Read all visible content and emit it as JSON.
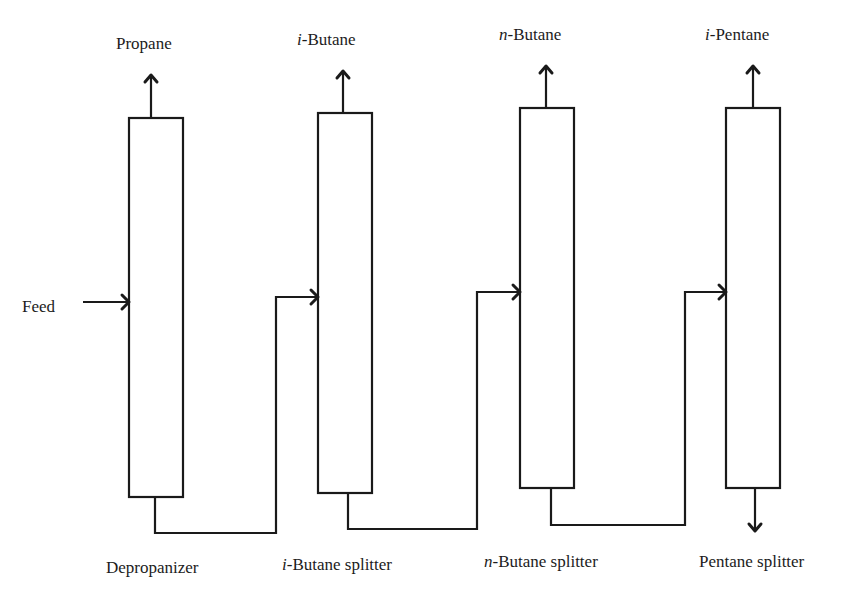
{
  "diagram": {
    "type": "process-flow",
    "feed_label": "Feed",
    "columns": [
      {
        "name": "Depropanizer",
        "top_product_prefix": "",
        "top_product": "Propane",
        "name_prefix": ""
      },
      {
        "name": "Butane splitter",
        "name_prefix": "i",
        "top_product_prefix": "i",
        "top_product": "Butane"
      },
      {
        "name": "Butane splitter",
        "name_prefix": "n",
        "top_product_prefix": "n",
        "top_product": "Butane"
      },
      {
        "name": "Pentane splitter",
        "name_prefix": "",
        "top_product_prefix": "i",
        "top_product": "Pentane"
      }
    ],
    "labels": {
      "top": [
        "Propane",
        "i-Butane",
        "n-Butane",
        "i-Pentane"
      ],
      "bottom": [
        "Depropanizer",
        "i-Butane splitter",
        "n-Butane splitter",
        "Pentane splitter"
      ]
    },
    "flows": [
      {
        "from": "Feed",
        "to": "Depropanizer"
      },
      {
        "from": "Depropanizer bottoms",
        "to": "i-Butane splitter"
      },
      {
        "from": "i-Butane splitter bottoms",
        "to": "n-Butane splitter"
      },
      {
        "from": "n-Butane splitter bottoms",
        "to": "Pentane splitter"
      },
      {
        "from": "Pentane splitter bottoms",
        "to": "outlet"
      }
    ]
  }
}
